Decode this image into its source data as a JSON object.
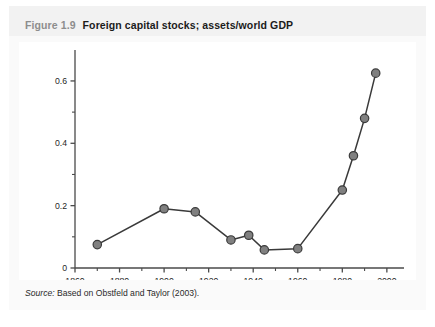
{
  "figure": {
    "number": "Figure 1.9",
    "title": "Foreign capital stocks; assets/world GDP",
    "source_label": "Source:",
    "source_text": " Based on Obstfeld and Taylor (2003)."
  },
  "colors": {
    "panel_background": "#f4f4f4",
    "plot_background": "#ffffff",
    "axis": "#4a4a4a",
    "line": "#3a3a3a",
    "marker_fill": "#808080",
    "marker_stroke": "#3a3a3a",
    "title_number": "#8d8d8d",
    "title_text": "#1b1b1b"
  },
  "chart_data": {
    "type": "line",
    "title": "Foreign capital stocks; assets/world GDP",
    "xlabel": "",
    "ylabel": "",
    "xlim": [
      1860,
      2005
    ],
    "ylim": [
      0,
      0.68
    ],
    "grid": false,
    "legend": "none",
    "x_ticks_major": [
      1860,
      1880,
      1900,
      1920,
      1940,
      1960,
      1980,
      2000
    ],
    "x_tick_labels": [
      "1860",
      "1880",
      "1900",
      "1920",
      "1940",
      "1960",
      "1980",
      "2000"
    ],
    "x_ticks_minor": [
      1870,
      1890,
      1910,
      1930,
      1950,
      1970,
      1990
    ],
    "y_ticks_major": [
      0,
      0.2,
      0.4,
      0.6
    ],
    "y_tick_labels": [
      "0",
      "0.2",
      "0.4",
      "0.6"
    ],
    "y_ticks_minor": [
      0.1,
      0.3,
      0.5
    ],
    "series": [
      {
        "name": "Foreign capital stocks / world GDP",
        "x": [
          1870,
          1900,
          1914,
          1930,
          1938,
          1945,
          1960,
          1980,
          1985,
          1990,
          1995
        ],
        "values": [
          0.075,
          0.19,
          0.18,
          0.09,
          0.105,
          0.058,
          0.062,
          0.25,
          0.36,
          0.48,
          0.625
        ]
      }
    ]
  }
}
